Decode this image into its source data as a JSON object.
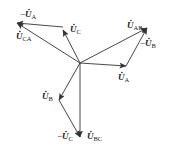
{
  "diagram": {
    "type": "phasor-diagram",
    "origin": [
      80,
      63
    ],
    "color": "#333333",
    "phasors": [
      {
        "id": "UA",
        "from": [
          80,
          63
        ],
        "to": [
          126,
          66
        ],
        "label": "U",
        "sub": "A",
        "prefix": "",
        "label_pos": [
          118,
          80
        ]
      },
      {
        "id": "UC",
        "from": [
          80,
          63
        ],
        "to": [
          63,
          30
        ],
        "label": "U",
        "sub": "C",
        "prefix": "",
        "label_pos": [
          70,
          32
        ]
      },
      {
        "id": "UB",
        "from": [
          80,
          63
        ],
        "to": [
          59,
          100
        ],
        "label": "U",
        "sub": "B",
        "prefix": "",
        "label_pos": [
          42,
          99
        ]
      },
      {
        "id": "negUA",
        "from": [
          63,
          27
        ],
        "to": [
          17,
          23
        ],
        "label": "U",
        "sub": "A",
        "prefix": "−",
        "label_pos": [
          20,
          17
        ]
      },
      {
        "id": "UCA",
        "from": [
          80,
          63
        ],
        "to": [
          17,
          23
        ],
        "label": "U",
        "sub": "CA",
        "prefix": "",
        "label_pos": [
          16,
          39
        ]
      },
      {
        "id": "negUB",
        "from": [
          126,
          66
        ],
        "to": [
          147,
          28
        ],
        "label": "U",
        "sub": "B",
        "prefix": "−",
        "label_pos": [
          140,
          46
        ]
      },
      {
        "id": "UAB",
        "from": [
          80,
          63
        ],
        "to": [
          147,
          28
        ],
        "label": "U",
        "sub": "AB",
        "prefix": "",
        "label_pos": [
          127,
          28
        ]
      },
      {
        "id": "negUC",
        "from": [
          59,
          100
        ],
        "to": [
          80,
          137
        ],
        "label": "U",
        "sub": "C",
        "prefix": "−",
        "label_pos": [
          57,
          139
        ]
      },
      {
        "id": "UBC",
        "from": [
          80,
          63
        ],
        "to": [
          80,
          137
        ],
        "label": "U",
        "sub": "BC",
        "prefix": "",
        "label_pos": [
          87,
          139
        ]
      }
    ]
  }
}
